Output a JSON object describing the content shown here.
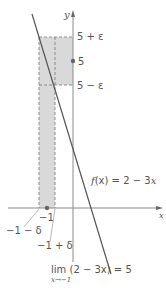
{
  "diagram": {
    "axes": {
      "x_label": "x",
      "y_label": "y"
    },
    "function_label": {
      "f": "f",
      "paren": "(x) = 2 − 3",
      "var": "x"
    },
    "y_labels": {
      "upper": "5 + ε",
      "center": "5",
      "lower": "5 − ε"
    },
    "x_labels": {
      "center": "−1",
      "left": "−1 − δ",
      "right": "−1 + δ"
    },
    "limit": {
      "expression": "lim (2 − 3x) = 5",
      "subscript": "x→−1"
    },
    "colors": {
      "shade": "#d9d9d9",
      "axis": "#8a8a8a",
      "line": "#555555",
      "dash": "#777777",
      "point": "#666666",
      "text": "#555555"
    }
  }
}
